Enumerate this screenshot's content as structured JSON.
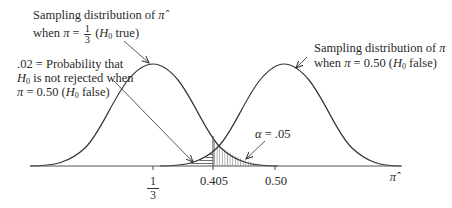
{
  "figure": {
    "type": "hypothesis-test-power-diagram",
    "axis_variable": "π̂",
    "labels": {
      "h0_dist": {
        "line1_prefix": "Sampling distribution of ",
        "line1_symbol": "π̂",
        "line2_prefix": "when ",
        "line2_pi": "π",
        "line2_eq": " = ",
        "line2_num": "1",
        "line2_den": "3",
        "line2_paren_open": " (",
        "line2_H": "H",
        "line2_sub": "0",
        "line2_suffix": " true)"
      },
      "ha_dist": {
        "line1_prefix": "Sampling distribution of ",
        "line1_symbol": "π",
        "line2_prefix": "when ",
        "line2_pi": "π",
        "line2_value": " = 0.50 (",
        "line2_H": "H",
        "line2_sub": "0",
        "line2_suffix": " false)"
      },
      "beta": {
        "line1": ".02 = Probability that",
        "line2_H": "H",
        "line2_sub": "0",
        "line2_suffix": " is not rejected when",
        "line3_pi": "π",
        "line3_value": " = 0.50 (",
        "line3_H": "H",
        "line3_sub": "0",
        "line3_suffix": " false)"
      },
      "alpha": {
        "symbol": "α",
        "value": " = .05"
      }
    },
    "ticks": [
      {
        "id": "one-third",
        "num": "1",
        "den": "3",
        "value": 0.3333
      },
      {
        "id": "critical",
        "label": "0.405",
        "value": 0.405
      },
      {
        "id": "half",
        "label": "0.50",
        "value": 0.5
      }
    ],
    "axis_label": "π̂",
    "probabilities": {
      "beta": 0.02,
      "alpha": 0.05
    },
    "colors": {
      "line": "#333333",
      "hatch": "#555555",
      "background": "#ffffff"
    }
  }
}
